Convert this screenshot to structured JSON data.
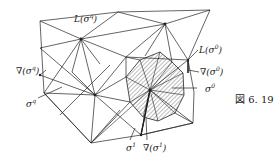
{
  "figure": {
    "caption": "図 6. 19",
    "labels": {
      "L_sigma_q": "L(σ",
      "L_sigma_q_sup": "q",
      "L_sigma_q_close": ")",
      "nabla_sigma_q": "∇(σ",
      "nabla_sigma_q_sup": "q",
      "nabla_sigma_q_close": ")",
      "sigma_q": "σ",
      "sigma_q_sup": "q",
      "L_sigma_0": "L(σ",
      "L_sigma_0_sup": "0",
      "L_sigma_0_close": ")",
      "nabla_sigma_0": "∇(σ",
      "nabla_sigma_0_sup": "0",
      "nabla_sigma_0_close": ")",
      "sigma_0": "σ",
      "sigma_0_sup": "0",
      "sigma_1": "σ",
      "sigma_1_sup": "1",
      "nabla_sigma_1": "∇(σ",
      "nabla_sigma_1_sup": "1",
      "nabla_sigma_1_close": ")"
    },
    "colors": {
      "line": "#222222",
      "hatch": "#555555",
      "background": "#ffffff"
    }
  }
}
